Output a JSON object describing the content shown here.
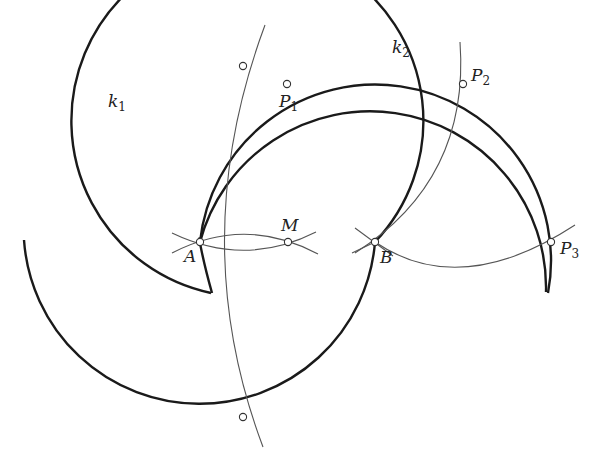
{
  "diagram": {
    "type": "geometric-construction",
    "colors": {
      "background": "#ffffff",
      "stroke": "#1a1a1a",
      "thin_stroke": "#555555",
      "point_fill": "#ffffff"
    },
    "circles": [
      {
        "name": "k1",
        "label": "k",
        "subscript": "1",
        "center": "A",
        "cx": 200,
        "cy": 240,
        "r": 176
      },
      {
        "name": "k2",
        "label": "k",
        "subscript": "2",
        "center": "B",
        "cx": 375,
        "cy": 240,
        "r": 176
      }
    ],
    "points": [
      {
        "name": "A",
        "label": "A",
        "subscript": "",
        "x": 200,
        "y": 242
      },
      {
        "name": "M",
        "label": "M",
        "subscript": "",
        "x": 288,
        "y": 242
      },
      {
        "name": "B",
        "label": "B",
        "subscript": "",
        "x": 375,
        "y": 242
      },
      {
        "name": "P1",
        "label": "P",
        "subscript": "1",
        "x": 287,
        "y": 84
      },
      {
        "name": "P2",
        "label": "P",
        "subscript": "2",
        "x": 463,
        "y": 84
      },
      {
        "name": "P3",
        "label": "P",
        "subscript": "3",
        "x": 551,
        "y": 242
      },
      {
        "name": "k1-top-intersection",
        "label": "",
        "subscript": "",
        "x": 243,
        "y": 66
      },
      {
        "name": "k1-bottom-intersection",
        "label": "",
        "subscript": "",
        "x": 243,
        "y": 417
      }
    ],
    "labels": {
      "k1": {
        "main": "k",
        "sub": "1"
      },
      "k2": {
        "main": "k",
        "sub": "2"
      },
      "A": "A",
      "B": "B",
      "M": "M",
      "P1": {
        "main": "P",
        "sub": "1"
      },
      "P2": {
        "main": "P",
        "sub": "2"
      },
      "P3": {
        "main": "P",
        "sub": "3"
      }
    }
  }
}
